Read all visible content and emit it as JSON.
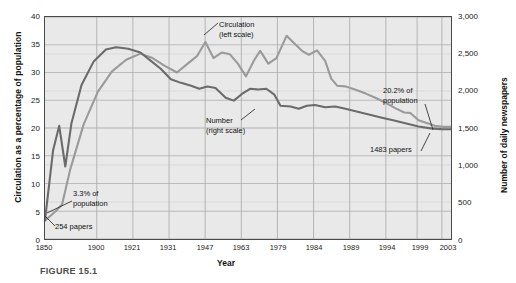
{
  "figure": {
    "caption": "FIGURE 15.1"
  },
  "chart_data": {
    "type": "line",
    "title": "",
    "xlabel": "Year",
    "ylabel": "Circulation as a percentage of population",
    "y2label": "Number of daily newspapers",
    "grid": true,
    "legend_position": "inline-annotations",
    "xlim": [
      1850,
      2003
    ],
    "ylim": [
      0,
      40
    ],
    "y2lim": [
      0,
      3000
    ],
    "xticklabels": [
      "1850",
      "1900",
      "1921",
      "1931",
      "1947",
      "1963",
      "1979",
      "1984",
      "1989",
      "1994",
      "1999",
      "2003"
    ],
    "yticklabels": [
      "0",
      "5",
      "10",
      "15",
      "20",
      "25",
      "30",
      "35",
      "40"
    ],
    "y2ticklabels": [
      "0",
      "500",
      "1,000",
      "1,500",
      "2,000",
      "2,500",
      "3,000"
    ],
    "colors": {
      "circulation": "#9a9a9a",
      "number": "#6b6b6b",
      "plot_bg": "#e9e9e9",
      "grid": "#b8b8b8",
      "frame": "#4a4a4a"
    },
    "series": [
      {
        "name": "Circulation (left scale)",
        "axis": "left",
        "color": "#9a9a9a",
        "points": [
          [
            0.0,
            3.3
          ],
          [
            2.6,
            5.0
          ],
          [
            4.2,
            6.2
          ],
          [
            6.2,
            12.5
          ],
          [
            9.5,
            20.6
          ],
          [
            13.0,
            26.5
          ],
          [
            16.5,
            30.2
          ],
          [
            20.0,
            32.3
          ],
          [
            23.5,
            33.4
          ],
          [
            26.5,
            32.6
          ],
          [
            29.5,
            31.2
          ],
          [
            32.5,
            30.0
          ],
          [
            35.0,
            31.5
          ],
          [
            37.5,
            33.0
          ],
          [
            39.5,
            35.5
          ],
          [
            41.5,
            32.6
          ],
          [
            43.5,
            33.6
          ],
          [
            45.5,
            33.3
          ],
          [
            47.5,
            31.6
          ],
          [
            49.5,
            29.3
          ],
          [
            51.5,
            32.2
          ],
          [
            53.0,
            33.9
          ],
          [
            55.0,
            31.6
          ],
          [
            57.0,
            32.6
          ],
          [
            59.5,
            36.6
          ],
          [
            61.5,
            35.2
          ],
          [
            63.5,
            33.8
          ],
          [
            65.0,
            33.2
          ],
          [
            67.0,
            34.0
          ],
          [
            69.0,
            32.1
          ],
          [
            70.5,
            28.9
          ],
          [
            72.0,
            27.6
          ],
          [
            74.0,
            27.5
          ],
          [
            76.5,
            26.9
          ],
          [
            79.0,
            26.2
          ],
          [
            81.5,
            25.4
          ],
          [
            84.0,
            24.5
          ],
          [
            86.5,
            23.5
          ],
          [
            88.5,
            22.8
          ],
          [
            90.0,
            22.7
          ],
          [
            92.0,
            21.4
          ],
          [
            94.0,
            20.9
          ],
          [
            96.0,
            20.4
          ],
          [
            98.0,
            20.2
          ],
          [
            100.0,
            20.2
          ]
        ]
      },
      {
        "name": "Number (right scale)",
        "axis": "right",
        "color": "#6b6b6b",
        "points": [
          [
            0.0,
            254
          ],
          [
            2.0,
            1200
          ],
          [
            3.5,
            1530
          ],
          [
            5.0,
            980
          ],
          [
            6.5,
            1560
          ],
          [
            9.0,
            2080
          ],
          [
            12.0,
            2400
          ],
          [
            15.0,
            2560
          ],
          [
            17.5,
            2590
          ],
          [
            20.5,
            2570
          ],
          [
            23.5,
            2520
          ],
          [
            26.0,
            2410
          ],
          [
            28.5,
            2300
          ],
          [
            31.0,
            2160
          ],
          [
            33.5,
            2110
          ],
          [
            36.0,
            2070
          ],
          [
            38.0,
            2030
          ],
          [
            40.0,
            2060
          ],
          [
            42.0,
            2040
          ],
          [
            44.5,
            1910
          ],
          [
            46.5,
            1870
          ],
          [
            48.5,
            1960
          ],
          [
            50.5,
            2030
          ],
          [
            52.5,
            2020
          ],
          [
            54.5,
            2030
          ],
          [
            56.5,
            1950
          ],
          [
            58.0,
            1800
          ],
          [
            60.5,
            1790
          ],
          [
            62.5,
            1760
          ],
          [
            64.5,
            1800
          ],
          [
            66.5,
            1810
          ],
          [
            69.0,
            1780
          ],
          [
            71.5,
            1790
          ],
          [
            74.0,
            1760
          ],
          [
            77.0,
            1720
          ],
          [
            80.0,
            1680
          ],
          [
            83.0,
            1640
          ],
          [
            86.0,
            1600
          ],
          [
            89.0,
            1560
          ],
          [
            92.0,
            1520
          ],
          [
            95.0,
            1495
          ],
          [
            97.5,
            1485
          ],
          [
            100.0,
            1483
          ]
        ]
      }
    ],
    "annotations": [
      {
        "id": "circulation-label",
        "text_lines": [
          "Circulation",
          "(left scale)"
        ]
      },
      {
        "id": "number-label",
        "text_lines": [
          "Number",
          "(right scale)"
        ]
      },
      {
        "id": "pct-start-label",
        "text_lines": [
          "3.3% of",
          "population"
        ]
      },
      {
        "id": "papers-start-label",
        "text_lines": [
          "254 papers"
        ]
      },
      {
        "id": "pct-end-label",
        "text_lines": [
          "20.2% of",
          "population"
        ]
      },
      {
        "id": "papers-end-label",
        "text_lines": [
          "1483 papers"
        ]
      }
    ]
  }
}
